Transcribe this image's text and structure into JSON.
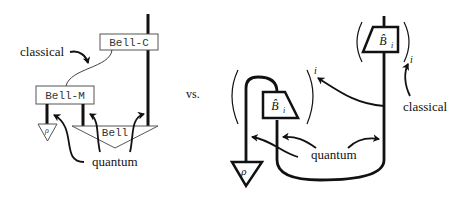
{
  "left_diagram": {
    "boxes": {
      "bell_c": "Bell-C",
      "bell_m": "Bell-M",
      "bell_state": "Bell"
    },
    "state_label": "ρ",
    "annotations": {
      "classical": "classical",
      "quantum": "quantum"
    }
  },
  "separator": "vs.",
  "right_diagram": {
    "effect_label_top": "B̂",
    "effect_label_top_sub": "i",
    "effect_label_inner": "B̂",
    "effect_label_inner_sub": "i",
    "state_label": "ρ",
    "sum_index_inner": "i",
    "sum_index_outer": "i",
    "annotations": {
      "classical": "classical",
      "quantum": "quantum"
    }
  },
  "colors": {
    "ink": "#111111",
    "box_border": "#555555",
    "background": "#ffffff"
  }
}
